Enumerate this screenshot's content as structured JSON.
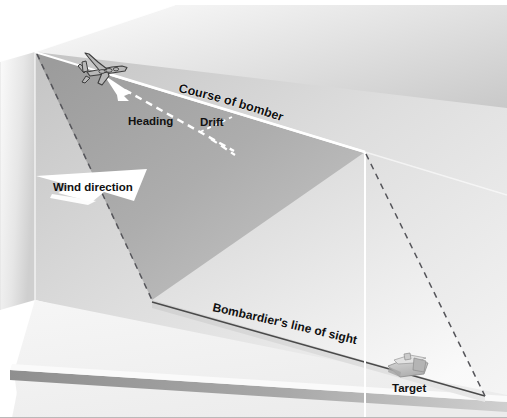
{
  "diagram": {
    "background_color": "#ffffff",
    "border_color": "#b9b9b9"
  },
  "labels": {
    "course_of_bomber": "Course of bomber",
    "heading": "Heading",
    "drift": "Drift",
    "wind_direction": "Wind direction",
    "line_of_sight": "Bombardier's line of sight",
    "target": "Target"
  },
  "objects": {
    "bomber": "four-engine-bomber-silhouette",
    "target_building": "industrial-target-building",
    "wind_arrow": "wind-arrow-banner",
    "heading_arrow": "heading-arrow"
  },
  "colors": {
    "panel_back_light": "#e4e4e4",
    "panel_back_dark": "#b7b7b7",
    "panel_side_light": "#f3f3f3",
    "panel_side_dark": "#cfcfcf",
    "panel_top_light": "#fbfbfb",
    "panel_top_dark": "#c6c6c6",
    "sight_plane_dark": "#a3a3a3",
    "sight_plane_light": "#c8c8c8",
    "ground_top": "#f2f2f2",
    "ground_edge": "#9d9d9d",
    "ground_strip": "#dcdcdc",
    "line_white": "#ffffff",
    "line_dark": "#3a3a3a",
    "text": "#111111",
    "bomber_outline": "#3d3d3d",
    "bomber_fill": "#b6b6b6",
    "target_fill": "#c9c9c9",
    "target_outline": "#8d8d8d"
  },
  "geometry": {
    "apex_top": [
      175,
      5
    ],
    "corner_top_left": [
      35,
      52
    ],
    "corner_back_right_top": [
      365,
      152
    ],
    "ground_meet_left": [
      152,
      300
    ],
    "dashed_bottom_right": [
      485,
      395
    ],
    "plane_position": [
      100,
      68
    ],
    "target_position": [
      408,
      370
    ]
  }
}
